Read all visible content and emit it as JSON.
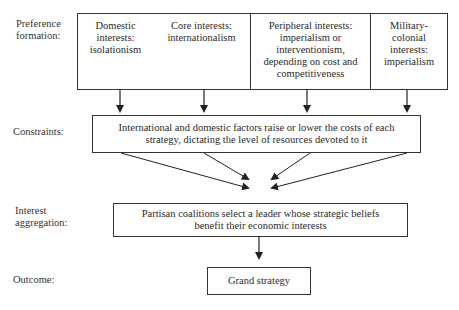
{
  "stages": {
    "preference": "Preference formation:",
    "constraints": "Constraints:",
    "aggregation": "Interest aggregation:",
    "outcome": "Outcome:"
  },
  "preference_boxes": [
    {
      "text": "Domestic interests: isolationism"
    },
    {
      "text": "Core interests: internationalism"
    },
    {
      "text": "Peripheral interests: imperialism or interventionism, depending on cost and competitiveness"
    },
    {
      "text": "Military-colonial interests: imperialism"
    }
  ],
  "constraints_box": {
    "text": "International and domestic factors raise or lower the costs of each strategy, dictating the level of resources devoted to it"
  },
  "aggregation_box": {
    "text": "Partisan coalitions select a leader whose strategic beliefs benefit their economic interests"
  },
  "outcome_box": {
    "text": "Grand strategy"
  },
  "colors": {
    "line": "#333333",
    "text": "#2a2a2a",
    "background": "#ffffff"
  }
}
